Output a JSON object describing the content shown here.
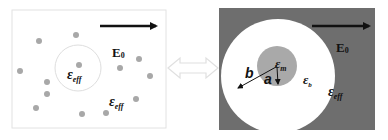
{
  "left_panel": {
    "field_label": "E",
    "field_sub": "0",
    "inner_label": "ε",
    "inner_sub": "eff",
    "outer_label": "ε",
    "outer_sub": "eff",
    "colors": {
      "background": "#ffffff",
      "border": "#e2e2e2",
      "dot": "#a8a8a8",
      "circle": "#dedede"
    },
    "dots": [
      [
        39,
        41
      ],
      [
        76,
        35
      ],
      [
        20,
        71
      ],
      [
        79,
        65
      ],
      [
        120,
        68
      ],
      [
        139,
        59
      ],
      [
        150,
        76
      ],
      [
        47,
        82
      ],
      [
        47,
        94
      ],
      [
        36,
        108
      ],
      [
        82,
        114
      ],
      [
        106,
        113
      ],
      [
        136,
        99
      ]
    ]
  },
  "connector": {
    "type": "double-arrow",
    "color": "#e4e4e4"
  },
  "right_panel": {
    "field_label": "E",
    "field_sub": "0",
    "core_label": "ε",
    "core_sub": "m",
    "shell_label": "ε",
    "shell_sub": "b",
    "medium_label": "ε",
    "medium_sub": "eff",
    "radius_inner_label": "a",
    "radius_outer_label": "b",
    "colors": {
      "background": "#6e6e6e",
      "shell": "#ffffff",
      "core": "#a9a9a9"
    }
  }
}
